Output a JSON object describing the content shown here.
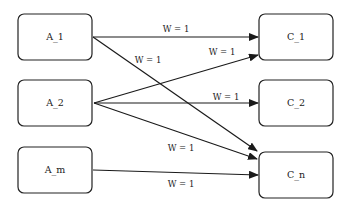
{
  "diagram": {
    "type": "bipartite-weighted-graph",
    "colors": {
      "stroke": "#222222",
      "fill": "#ffffff",
      "text": "#222222",
      "background": "#ffffff"
    },
    "nodes": [
      {
        "id": "A_1",
        "label": "A_1",
        "x": 18,
        "y": 14,
        "w": 74,
        "h": 46
      },
      {
        "id": "A_2",
        "label": "A_2",
        "x": 18,
        "y": 80,
        "w": 74,
        "h": 46
      },
      {
        "id": "A_m",
        "label": "A_m",
        "x": 18,
        "y": 147,
        "w": 74,
        "h": 46
      },
      {
        "id": "C_1",
        "label": "C_1",
        "x": 259,
        "y": 14,
        "w": 74,
        "h": 46
      },
      {
        "id": "C_2",
        "label": "C_2",
        "x": 259,
        "y": 80,
        "w": 74,
        "h": 46
      },
      {
        "id": "C_n",
        "label": "C_n",
        "x": 259,
        "y": 152,
        "w": 74,
        "h": 46
      }
    ],
    "edges": [
      {
        "from": "A_1",
        "to": "C_1",
        "label": "W = 1",
        "x1": 93,
        "y1": 37,
        "x2": 258,
        "y2": 37,
        "lx": 176,
        "ly": 29
      },
      {
        "from": "A_1",
        "to": "C_n",
        "label": "W = 1",
        "x1": 93,
        "y1": 37,
        "x2": 257,
        "y2": 151,
        "lx": 148,
        "ly": 60
      },
      {
        "from": "A_2",
        "to": "C_1",
        "label": "W = 1",
        "x1": 94,
        "y1": 103,
        "x2": 258,
        "y2": 55,
        "lx": 222,
        "ly": 52
      },
      {
        "from": "A_2",
        "to": "C_2",
        "label": "W = 1",
        "x1": 94,
        "y1": 103,
        "x2": 258,
        "y2": 103,
        "lx": 226,
        "ly": 97
      },
      {
        "from": "A_2",
        "to": "C_n",
        "label": "W = 1",
        "x1": 94,
        "y1": 103,
        "x2": 257,
        "y2": 159,
        "lx": 181,
        "ly": 148
      },
      {
        "from": "A_m",
        "to": "C_n",
        "label": "W = 1",
        "x1": 93,
        "y1": 170,
        "x2": 258,
        "y2": 175,
        "lx": 181,
        "ly": 184
      }
    ]
  }
}
